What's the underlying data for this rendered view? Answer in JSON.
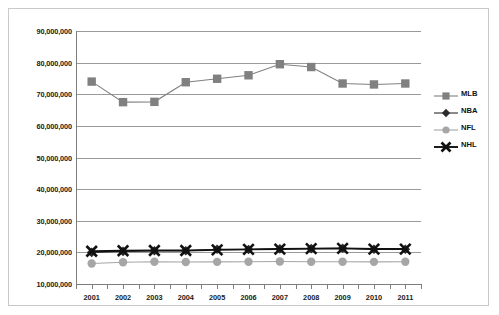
{
  "chart_data": {
    "type": "line",
    "title": "",
    "xlabel": "",
    "ylabel": "",
    "grid": true,
    "legend_position": "right",
    "categories": [
      "2001",
      "2002",
      "2003",
      "2004",
      "2005",
      "2006",
      "2007",
      "2008",
      "2009",
      "2010",
      "2011"
    ],
    "ylim": [
      10000000,
      90000000
    ],
    "ytick_labels": [
      "90,000,000",
      "80,000,000",
      "70,000,000",
      "60,000,000",
      "50,000,000",
      "40,000,000",
      "30,000,000",
      "20,000,000",
      "10,000,000"
    ],
    "ytick_values": [
      90000000,
      80000000,
      70000000,
      60000000,
      50000000,
      40000000,
      30000000,
      20000000,
      10000000
    ],
    "series": [
      {
        "name": "MLB",
        "marker": "square",
        "color": "#808080",
        "values": [
          74000000,
          67500000,
          67600000,
          73800000,
          74900000,
          76000000,
          79500000,
          78600000,
          73400000,
          73100000,
          73400000
        ]
      },
      {
        "name": "NBA",
        "marker": "diamond",
        "color": "#2b2b2b",
        "values": [
          20000000,
          20300000,
          20500000,
          20500000,
          21000000,
          20900000,
          21100000,
          21200000,
          21300000,
          21000000,
          21000000
        ]
      },
      {
        "name": "NFL",
        "marker": "circle",
        "color": "#a6a6a6",
        "values": [
          16500000,
          16900000,
          17050000,
          16950000,
          17000000,
          17050000,
          17100000,
          17050000,
          17050000,
          17000000,
          17050000
        ]
      },
      {
        "name": "NHL",
        "marker": "cross",
        "color": "#111111",
        "values": [
          20350000,
          20500000,
          20600000,
          20600000,
          20800000,
          20950000,
          21050000,
          21200000,
          21250000,
          21050000,
          21050000
        ]
      }
    ]
  },
  "legend": {
    "items": [
      {
        "label": "MLB",
        "marker": "square",
        "color": "#808080"
      },
      {
        "label": "NBA",
        "marker": "diamond",
        "color": "#2b2b2b"
      },
      {
        "label": "NFL",
        "marker": "circle",
        "color": "#a6a6a6"
      },
      {
        "label": "NHL",
        "marker": "cross",
        "color": "#111111"
      }
    ]
  }
}
